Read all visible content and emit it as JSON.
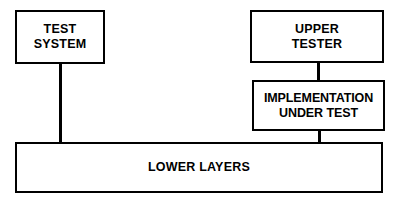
{
  "diagram": {
    "background_color": "#ffffff",
    "stroke_color": "#000000",
    "text_color": "#000000",
    "nodes": [
      {
        "id": "test-system",
        "label": "TEST\nSYSTEM",
        "label_lines": [
          "TEST",
          "SYSTEM"
        ]
      },
      {
        "id": "upper-tester",
        "label": "UPPER\nTESTER",
        "label_lines": [
          "UPPER",
          "TESTER"
        ]
      },
      {
        "id": "implementation-under-test",
        "label": "IMPLEMENTATION\nUNDER TEST",
        "label_lines": [
          "IMPLEMENTATION",
          "UNDER TEST"
        ]
      },
      {
        "id": "lower-layers",
        "label": "LOWER LAYERS",
        "label_lines": [
          "LOWER LAYERS"
        ]
      }
    ],
    "connectors": [
      {
        "id": "test-system-to-lower-layers",
        "from": "test-system",
        "to": "lower-layers",
        "style": "solid"
      },
      {
        "id": "upper-tester-to-iut",
        "from": "upper-tester",
        "to": "implementation-under-test",
        "style": "solid"
      },
      {
        "id": "iut-to-lower-layers",
        "from": "implementation-under-test",
        "to": "lower-layers",
        "style": "solid"
      }
    ]
  }
}
